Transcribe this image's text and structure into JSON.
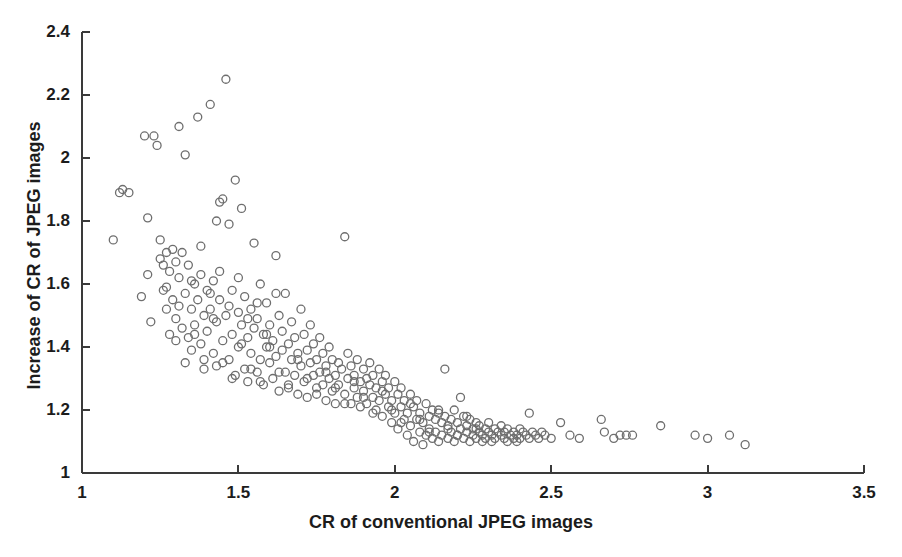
{
  "chart_data": {
    "type": "scatter",
    "title": "",
    "xlabel": "CR of conventional JPEG images",
    "ylabel": "Increase of CR of JPEG images",
    "xlim": [
      1,
      3.5
    ],
    "ylim": [
      1,
      2.4
    ],
    "xticks": [
      "1",
      "1.5",
      "2",
      "2.5",
      "3",
      "3.5"
    ],
    "xtick_values": [
      1,
      1.5,
      2,
      2.5,
      3,
      3.5
    ],
    "yticks": [
      "1",
      "1.2",
      "1.4",
      "1.6",
      "1.8",
      "2",
      "2.2",
      "2.4"
    ],
    "ytick_values": [
      1,
      1.2,
      1.4,
      1.6,
      1.8,
      2,
      2.2,
      2.4
    ],
    "grid": false,
    "legend": null,
    "marker": "open-circle",
    "marker_color": "#6e6e6e",
    "marker_size": 8,
    "axis_color": "#3a3a3a",
    "background": "#ffffff",
    "series": [
      {
        "name": "JPEG images",
        "points": [
          [
            1.1,
            1.74
          ],
          [
            1.12,
            1.89
          ],
          [
            1.13,
            1.9
          ],
          [
            1.15,
            1.89
          ],
          [
            1.19,
            1.56
          ],
          [
            1.2,
            2.07
          ],
          [
            1.21,
            1.63
          ],
          [
            1.22,
            1.48
          ],
          [
            1.23,
            2.07
          ],
          [
            1.24,
            2.04
          ],
          [
            1.25,
            1.68
          ],
          [
            1.26,
            1.66
          ],
          [
            1.26,
            1.58
          ],
          [
            1.27,
            1.7
          ],
          [
            1.27,
            1.52
          ],
          [
            1.28,
            1.64
          ],
          [
            1.28,
            1.44
          ],
          [
            1.29,
            1.71
          ],
          [
            1.29,
            1.55
          ],
          [
            1.3,
            1.67
          ],
          [
            1.3,
            1.49
          ],
          [
            1.31,
            2.1
          ],
          [
            1.31,
            1.62
          ],
          [
            1.32,
            1.46
          ],
          [
            1.32,
            1.7
          ],
          [
            1.33,
            2.01
          ],
          [
            1.33,
            1.57
          ],
          [
            1.34,
            1.43
          ],
          [
            1.34,
            1.66
          ],
          [
            1.35,
            1.52
          ],
          [
            1.35,
            1.39
          ],
          [
            1.36,
            1.6
          ],
          [
            1.36,
            1.47
          ],
          [
            1.37,
            2.13
          ],
          [
            1.37,
            1.55
          ],
          [
            1.38,
            1.41
          ],
          [
            1.38,
            1.63
          ],
          [
            1.39,
            1.5
          ],
          [
            1.39,
            1.36
          ],
          [
            1.4,
            1.58
          ],
          [
            1.4,
            1.45
          ],
          [
            1.41,
            2.17
          ],
          [
            1.41,
            1.52
          ],
          [
            1.42,
            1.38
          ],
          [
            1.42,
            1.61
          ],
          [
            1.43,
            1.48
          ],
          [
            1.43,
            1.34
          ],
          [
            1.44,
            1.86
          ],
          [
            1.44,
            1.55
          ],
          [
            1.45,
            1.42
          ],
          [
            1.45,
            1.87
          ],
          [
            1.46,
            2.25
          ],
          [
            1.46,
            1.5
          ],
          [
            1.47,
            1.36
          ],
          [
            1.47,
            1.79
          ],
          [
            1.48,
            1.58
          ],
          [
            1.48,
            1.44
          ],
          [
            1.49,
            1.93
          ],
          [
            1.49,
            1.31
          ],
          [
            1.5,
            1.51
          ],
          [
            1.5,
            1.4
          ],
          [
            1.51,
            1.84
          ],
          [
            1.51,
            1.47
          ],
          [
            1.52,
            1.33
          ],
          [
            1.52,
            1.56
          ],
          [
            1.53,
            1.43
          ],
          [
            1.53,
            1.29
          ],
          [
            1.54,
            1.52
          ],
          [
            1.54,
            1.38
          ],
          [
            1.55,
            1.73
          ],
          [
            1.55,
            1.46
          ],
          [
            1.56,
            1.32
          ],
          [
            1.56,
            1.49
          ],
          [
            1.57,
            1.36
          ],
          [
            1.57,
            1.6
          ],
          [
            1.58,
            1.44
          ],
          [
            1.58,
            1.28
          ],
          [
            1.59,
            1.4
          ],
          [
            1.59,
            1.54
          ],
          [
            1.6,
            1.35
          ],
          [
            1.6,
            1.47
          ],
          [
            1.61,
            1.3
          ],
          [
            1.61,
            1.42
          ],
          [
            1.62,
            1.69
          ],
          [
            1.62,
            1.37
          ],
          [
            1.63,
            1.5
          ],
          [
            1.63,
            1.26
          ],
          [
            1.64,
            1.39
          ],
          [
            1.64,
            1.45
          ],
          [
            1.65,
            1.32
          ],
          [
            1.65,
            1.57
          ],
          [
            1.66,
            1.41
          ],
          [
            1.66,
            1.28
          ],
          [
            1.67,
            1.36
          ],
          [
            1.67,
            1.48
          ],
          [
            1.68,
            1.31
          ],
          [
            1.68,
            1.43
          ],
          [
            1.69,
            1.25
          ],
          [
            1.69,
            1.38
          ],
          [
            1.7,
            1.52
          ],
          [
            1.7,
            1.34
          ],
          [
            1.71,
            1.44
          ],
          [
            1.71,
            1.29
          ],
          [
            1.72,
            1.39
          ],
          [
            1.72,
            1.24
          ],
          [
            1.73,
            1.35
          ],
          [
            1.73,
            1.47
          ],
          [
            1.74,
            1.31
          ],
          [
            1.74,
            1.41
          ],
          [
            1.75,
            1.27
          ],
          [
            1.75,
            1.36
          ],
          [
            1.76,
            1.32
          ],
          [
            1.76,
            1.43
          ],
          [
            1.77,
            1.28
          ],
          [
            1.77,
            1.38
          ],
          [
            1.78,
            1.23
          ],
          [
            1.78,
            1.34
          ],
          [
            1.79,
            1.3
          ],
          [
            1.79,
            1.4
          ],
          [
            1.8,
            1.26
          ],
          [
            1.8,
            1.36
          ],
          [
            1.81,
            1.31
          ],
          [
            1.81,
            1.22
          ],
          [
            1.82,
            1.35
          ],
          [
            1.82,
            1.28
          ],
          [
            1.83,
            1.33
          ],
          [
            1.84,
            1.75
          ],
          [
            1.84,
            1.25
          ],
          [
            1.85,
            1.3
          ],
          [
            1.85,
            1.38
          ],
          [
            1.86,
            1.22
          ],
          [
            1.86,
            1.34
          ],
          [
            1.87,
            1.27
          ],
          [
            1.87,
            1.31
          ],
          [
            1.88,
            1.24
          ],
          [
            1.88,
            1.36
          ],
          [
            1.89,
            1.29
          ],
          [
            1.89,
            1.21
          ],
          [
            1.9,
            1.33
          ],
          [
            1.9,
            1.26
          ],
          [
            1.91,
            1.3
          ],
          [
            1.91,
            1.22
          ],
          [
            1.92,
            1.28
          ],
          [
            1.92,
            1.35
          ],
          [
            1.93,
            1.24
          ],
          [
            1.93,
            1.31
          ],
          [
            1.94,
            1.2
          ],
          [
            1.94,
            1.27
          ],
          [
            1.95,
            1.33
          ],
          [
            1.95,
            1.23
          ],
          [
            1.96,
            1.29
          ],
          [
            1.96,
            1.18
          ],
          [
            1.97,
            1.25
          ],
          [
            1.97,
            1.31
          ],
          [
            1.98,
            1.21
          ],
          [
            1.98,
            1.27
          ],
          [
            1.99,
            1.16
          ],
          [
            1.99,
            1.23
          ],
          [
            2.0,
            1.29
          ],
          [
            2.0,
            1.19
          ],
          [
            2.01,
            1.25
          ],
          [
            2.01,
            1.14
          ],
          [
            2.02,
            1.21
          ],
          [
            2.02,
            1.27
          ],
          [
            2.03,
            1.17
          ],
          [
            2.03,
            1.23
          ],
          [
            2.04,
            1.12
          ],
          [
            2.04,
            1.19
          ],
          [
            2.05,
            1.25
          ],
          [
            2.05,
            1.15
          ],
          [
            2.06,
            1.21
          ],
          [
            2.06,
            1.1
          ],
          [
            2.07,
            1.17
          ],
          [
            2.07,
            1.23
          ],
          [
            2.08,
            1.13
          ],
          [
            2.08,
            1.19
          ],
          [
            2.09,
            1.09
          ],
          [
            2.09,
            1.16
          ],
          [
            2.1,
            1.22
          ],
          [
            2.1,
            1.12
          ],
          [
            2.11,
            1.18
          ],
          [
            2.11,
            1.14
          ],
          [
            2.12,
            1.2
          ],
          [
            2.12,
            1.11
          ],
          [
            2.13,
            1.17
          ],
          [
            2.13,
            1.13
          ],
          [
            2.14,
            1.19
          ],
          [
            2.14,
            1.1
          ],
          [
            2.15,
            1.16
          ],
          [
            2.15,
            1.12
          ],
          [
            2.16,
            1.33
          ],
          [
            2.16,
            1.18
          ],
          [
            2.17,
            1.14
          ],
          [
            2.17,
            1.11
          ],
          [
            2.18,
            1.17
          ],
          [
            2.18,
            1.13
          ],
          [
            2.19,
            1.2
          ],
          [
            2.19,
            1.1
          ],
          [
            2.2,
            1.16
          ],
          [
            2.2,
            1.12
          ],
          [
            2.21,
            1.24
          ],
          [
            2.21,
            1.14
          ],
          [
            2.22,
            1.18
          ],
          [
            2.22,
            1.11
          ],
          [
            2.23,
            1.15
          ],
          [
            2.23,
            1.13
          ],
          [
            2.24,
            1.17
          ],
          [
            2.24,
            1.1
          ],
          [
            2.25,
            1.14
          ],
          [
            2.25,
            1.12
          ],
          [
            2.26,
            1.16
          ],
          [
            2.26,
            1.11
          ],
          [
            2.27,
            1.13
          ],
          [
            2.27,
            1.15
          ],
          [
            2.28,
            1.12
          ],
          [
            2.28,
            1.1
          ],
          [
            2.29,
            1.14
          ],
          [
            2.29,
            1.11
          ],
          [
            2.3,
            1.13
          ],
          [
            2.3,
            1.16
          ],
          [
            2.31,
            1.12
          ],
          [
            2.31,
            1.1
          ],
          [
            2.32,
            1.14
          ],
          [
            2.32,
            1.11
          ],
          [
            2.33,
            1.13
          ],
          [
            2.34,
            1.12
          ],
          [
            2.34,
            1.15
          ],
          [
            2.35,
            1.11
          ],
          [
            2.35,
            1.13
          ],
          [
            2.36,
            1.1
          ],
          [
            2.36,
            1.14
          ],
          [
            2.37,
            1.12
          ],
          [
            2.38,
            1.11
          ],
          [
            2.38,
            1.13
          ],
          [
            2.39,
            1.1
          ],
          [
            2.39,
            1.12
          ],
          [
            2.4,
            1.14
          ],
          [
            2.4,
            1.11
          ],
          [
            2.41,
            1.13
          ],
          [
            2.42,
            1.12
          ],
          [
            2.43,
            1.19
          ],
          [
            2.43,
            1.11
          ],
          [
            2.44,
            1.13
          ],
          [
            2.45,
            1.12
          ],
          [
            2.46,
            1.11
          ],
          [
            2.47,
            1.13
          ],
          [
            2.48,
            1.12
          ],
          [
            2.5,
            1.11
          ],
          [
            2.53,
            1.16
          ],
          [
            2.56,
            1.12
          ],
          [
            2.59,
            1.11
          ],
          [
            2.66,
            1.17
          ],
          [
            2.67,
            1.13
          ],
          [
            2.7,
            1.11
          ],
          [
            2.72,
            1.12
          ],
          [
            2.74,
            1.12
          ],
          [
            2.76,
            1.12
          ],
          [
            2.85,
            1.15
          ],
          [
            2.96,
            1.12
          ],
          [
            3.0,
            1.11
          ],
          [
            3.07,
            1.12
          ],
          [
            3.12,
            1.09
          ],
          [
            1.3,
            1.42
          ],
          [
            1.33,
            1.35
          ],
          [
            1.36,
            1.44
          ],
          [
            1.39,
            1.33
          ],
          [
            1.42,
            1.49
          ],
          [
            1.45,
            1.35
          ],
          [
            1.48,
            1.3
          ],
          [
            1.51,
            1.41
          ],
          [
            1.54,
            1.33
          ],
          [
            1.57,
            1.29
          ],
          [
            1.6,
            1.4
          ],
          [
            1.63,
            1.32
          ],
          [
            1.66,
            1.27
          ],
          [
            1.69,
            1.36
          ],
          [
            1.72,
            1.3
          ],
          [
            1.75,
            1.25
          ],
          [
            1.78,
            1.32
          ],
          [
            1.81,
            1.27
          ],
          [
            1.84,
            1.22
          ],
          [
            1.87,
            1.29
          ],
          [
            1.9,
            1.24
          ],
          [
            1.93,
            1.19
          ],
          [
            1.96,
            1.26
          ],
          [
            1.99,
            1.2
          ],
          [
            2.02,
            1.16
          ],
          [
            2.05,
            1.22
          ],
          [
            2.08,
            1.17
          ],
          [
            2.11,
            1.13
          ],
          [
            2.14,
            1.2
          ],
          [
            2.17,
            1.15
          ],
          [
            2.2,
            1.12
          ],
          [
            2.23,
            1.18
          ],
          [
            2.26,
            1.14
          ],
          [
            1.27,
            1.59
          ],
          [
            1.31,
            1.53
          ],
          [
            1.35,
            1.61
          ],
          [
            1.41,
            1.57
          ],
          [
            1.44,
            1.64
          ],
          [
            1.47,
            1.53
          ],
          [
            1.5,
            1.62
          ],
          [
            1.53,
            1.49
          ],
          [
            1.56,
            1.54
          ],
          [
            1.59,
            1.44
          ],
          [
            1.62,
            1.57
          ],
          [
            1.21,
            1.81
          ],
          [
            1.25,
            1.74
          ],
          [
            1.38,
            1.72
          ],
          [
            1.43,
            1.8
          ]
        ]
      }
    ]
  }
}
